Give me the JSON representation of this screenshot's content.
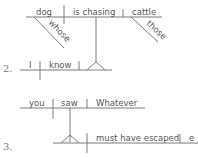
{
  "diagrams": [
    {
      "number": "",
      "subject": "dog",
      "verb": "is chasing",
      "object": "cattle",
      "modifiers": {
        "subject": "whose",
        "object": "those"
      }
    },
    {
      "number": "2.",
      "subject": "I",
      "verb": "know"
    },
    {
      "number": "3.",
      "subject": "you",
      "verb": "saw",
      "object": "Whatever",
      "clause_verb": "must have escaped",
      "clause_object_partial": "e"
    }
  ],
  "colors": {
    "line": "#7a7a7a",
    "text": "#555555"
  }
}
